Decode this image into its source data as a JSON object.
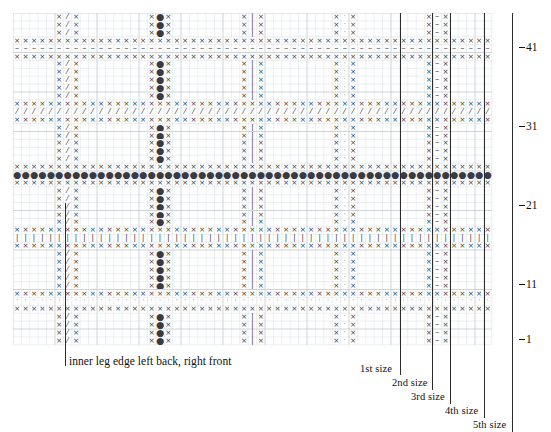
{
  "chart": {
    "type": "knitting-chart-grid",
    "grid": {
      "columns": 57,
      "rows": 42,
      "cell_width": 8.4,
      "cell_height": 7.9,
      "origin_x": 13,
      "origin_y": 13,
      "grid_color": "#d9dde0",
      "cell_text_color": "#41414a"
    },
    "symbols": {
      "x": "×",
      "slash": "⁄",
      "dot": "●",
      "bar": "❘",
      "tiny": "·",
      "dash": "–",
      "blank": ""
    },
    "symbol_legend": [
      {
        "key": "x",
        "glyph": "×",
        "name": "knit-stitch"
      },
      {
        "key": "slash",
        "glyph": "⁄",
        "name": "decrease-slant"
      },
      {
        "key": "dot",
        "glyph": "●",
        "name": "bobble-or-purl-dot"
      },
      {
        "key": "bar",
        "glyph": "❘",
        "name": "vertical-bar-stitch"
      },
      {
        "key": "tiny",
        "glyph": "·",
        "name": "small-dot-stitch"
      },
      {
        "key": "dash",
        "glyph": "–",
        "name": "dash-stitch"
      }
    ],
    "motif_columns": [
      {
        "start_col": 5,
        "center_symbol": "slash"
      },
      {
        "start_col": 16,
        "center_symbol": "dot"
      },
      {
        "start_col": 27,
        "center_symbol": "bar"
      },
      {
        "start_col": 38,
        "center_symbol": "tiny"
      },
      {
        "start_col": 49,
        "center_symbol": "dash"
      }
    ],
    "bands": [
      {
        "top_row_index": 3,
        "middle_symbol": "dash"
      },
      {
        "top_row_index": 11,
        "middle_symbol": "slash"
      },
      {
        "top_row_index": 19,
        "middle_symbol": "dot"
      },
      {
        "top_row_index": 27,
        "middle_symbol": "bar"
      },
      {
        "top_row_index": 35,
        "middle_symbol": "tiny"
      }
    ]
  },
  "row_numbers": [
    {
      "label": "41",
      "row": 41
    },
    {
      "label": "31",
      "row": 31
    },
    {
      "label": "21",
      "row": 21
    },
    {
      "label": "11",
      "row": 11
    },
    {
      "label": "1",
      "row": 1
    }
  ],
  "size_markers": [
    {
      "label": "1st size",
      "x": 400,
      "label_x": 360,
      "label_y": 375
    },
    {
      "label": "2nd size",
      "x": 432,
      "label_x": 392,
      "label_y": 390
    },
    {
      "label": "3rd size",
      "x": 450,
      "label_x": 412,
      "label_y": 404
    },
    {
      "label": "4th size",
      "x": 484,
      "label_x": 445,
      "label_y": 418
    },
    {
      "label": "5th size",
      "x": 512,
      "label_x": 474,
      "label_y": 432
    }
  ],
  "inner_leg": {
    "label": "inner leg edge left back, right front",
    "line_x": 65,
    "label_x": 69,
    "label_y": 361
  },
  "colors": {
    "grid_line": "#d9dde0",
    "grid_line_major": "#c3c9ce",
    "symbol": "#41414a",
    "marker_line": "#2b2b2b",
    "text": "#111111",
    "background": "#ffffff"
  }
}
